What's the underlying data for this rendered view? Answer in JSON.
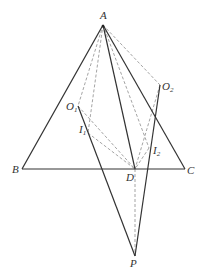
{
  "diagram": {
    "type": "geometry-figure",
    "points": {
      "A": {
        "label": "A",
        "x": 103,
        "y": 25
      },
      "B": {
        "label": "B",
        "x": 22,
        "y": 169
      },
      "C": {
        "label": "C",
        "x": 185,
        "y": 169
      },
      "D": {
        "label": "D",
        "x": 135,
        "y": 169
      },
      "P": {
        "label": "P",
        "x": 135,
        "y": 256
      },
      "O1": {
        "label": "O",
        "sub": "1",
        "x": 78,
        "y": 106
      },
      "O2": {
        "label": "O",
        "sub": "2",
        "x": 160,
        "y": 85
      },
      "I1": {
        "label": "I",
        "sub": "1",
        "x": 88,
        "y": 133
      },
      "I2": {
        "label": "I",
        "sub": "2",
        "x": 149,
        "y": 148
      }
    },
    "solid_segments": [
      [
        "A",
        "B"
      ],
      [
        "A",
        "C"
      ],
      [
        "B",
        "C"
      ],
      [
        "A",
        "D"
      ],
      [
        "O1",
        "P"
      ],
      [
        "O2",
        "P"
      ]
    ],
    "dashed_segments": [
      [
        "A",
        "O1"
      ],
      [
        "A",
        "I1"
      ],
      [
        "A",
        "I2"
      ],
      [
        "A",
        "O2"
      ],
      [
        "O1",
        "D"
      ],
      [
        "I1",
        "D"
      ],
      [
        "O2",
        "D"
      ],
      [
        "I2",
        "D"
      ],
      [
        "D",
        "P"
      ]
    ],
    "colors": {
      "solid": "#333333",
      "dashed": "#9a9a9a",
      "background": "#ffffff"
    }
  }
}
